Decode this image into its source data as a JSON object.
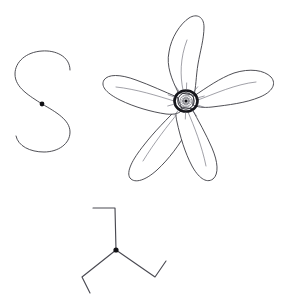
{
  "figure": {
    "background_color": "#ffffff",
    "width": 287,
    "height": 302,
    "stroke_color": "#3b3b42",
    "accent_color": "#101014",
    "caption": "",
    "elements": [
      {
        "name": "s-curve",
        "label": "S-shaped open curve with center node",
        "node_count": 1
      },
      {
        "name": "five-petal-flower",
        "label": "Five-petaled pinwheel flower with ringed center disc",
        "petal_count": 5
      },
      {
        "name": "triskelion",
        "label": "Three-armed Y figure with hooked arm ends and center node",
        "arm_count": 3
      }
    ]
  },
  "chart_data": {
    "type": "scatter",
    "xlabel": "",
    "ylabel": "",
    "xlim": [
      0,
      287
    ],
    "ylim": [
      0,
      302
    ],
    "grid": false,
    "legend": "none",
    "annotations": [
      "s-curve",
      "five-petal-flower",
      "triskelion"
    ],
    "series": [
      {
        "name": "node-points",
        "x": [
          42,
          186,
          116
        ],
        "y": [
          104,
          101,
          250
        ]
      }
    ]
  },
  "geometry": {
    "s_curve": {
      "name": "s-curve",
      "path": "M 70 70 C 70 56 55 50 42 51 C 26 52 15 62 15 74 C 15 88 30 96 42 104 C 56 112 70 120 70 132 C 70 144 58 152 44 152 C 30 152 18 146 16 136",
      "node": {
        "cx": 42,
        "cy": 104,
        "r": 2.4
      }
    },
    "flower": {
      "name": "five-petal-flower",
      "center": {
        "cx": 186,
        "cy": 101
      },
      "petals": [
        {
          "id": "petal-top",
          "outline": "M 178 92 C 172 80 166 66 169 52 C 171 38 180 24 189 18 C 197 13 204 17 204 27 C 204 39 200 52 198 64 C 196 76 196 88 194 95 Z",
          "vein": "M 183 90 C 180 76 180 58 187 40"
        },
        {
          "id": "petal-right",
          "outline": "M 194 96 C 206 88 220 78 234 73 C 250 68 264 70 271 77 C 277 84 272 92 260 97 C 246 103 228 105 212 107 C 203 108 197 107 193 105 Z",
          "vein": "M 198 100 C 214 94 236 84 256 82"
        },
        {
          "id": "petal-lower-right",
          "outline": "M 192 109 C 198 120 206 134 212 148 C 218 162 219 174 213 179 C 206 184 198 177 192 166 C 185 153 180 136 177 122 C 175 114 176 109 179 107 Z",
          "vein": "M 188 112 C 194 126 202 146 206 166"
        },
        {
          "id": "petal-lower-left",
          "outline": "M 178 108 C 168 118 154 132 144 145 C 132 160 126 172 130 178 C 135 184 146 180 157 170 C 169 159 180 144 187 131 C 191 123 192 116 190 112 Z",
          "vein": "M 178 113 C 168 125 154 143 143 161"
        },
        {
          "id": "petal-left",
          "outline": "M 177 97 C 165 92 150 85 136 80 C 120 74 108 74 104 80 C 100 87 108 94 120 100 C 134 107 152 112 166 114 C 175 115 180 113 182 110 Z",
          "vein": "M 174 101 C 158 96 136 89 116 87"
        }
      ],
      "core": {
        "ring_outer_rx": 11.5,
        "ring_outer_ry": 10.5,
        "ring_mid_r": 8.2,
        "ring_inner_r": 6.0,
        "spoke_count": 14
      }
    },
    "triskelion": {
      "name": "triskelion",
      "center": {
        "cx": 116,
        "cy": 250
      },
      "arms": [
        {
          "id": "arm-top",
          "path": "M 116 250 L 115 208 L 93 208"
        },
        {
          "id": "arm-lower-right",
          "path": "M 116 250 L 155 277 L 166 261"
        },
        {
          "id": "arm-lower-left",
          "path": "M 116 250 L 82 277 L 90 293"
        }
      ],
      "node": {
        "cx": 116,
        "cy": 250,
        "r": 2.6
      }
    }
  }
}
